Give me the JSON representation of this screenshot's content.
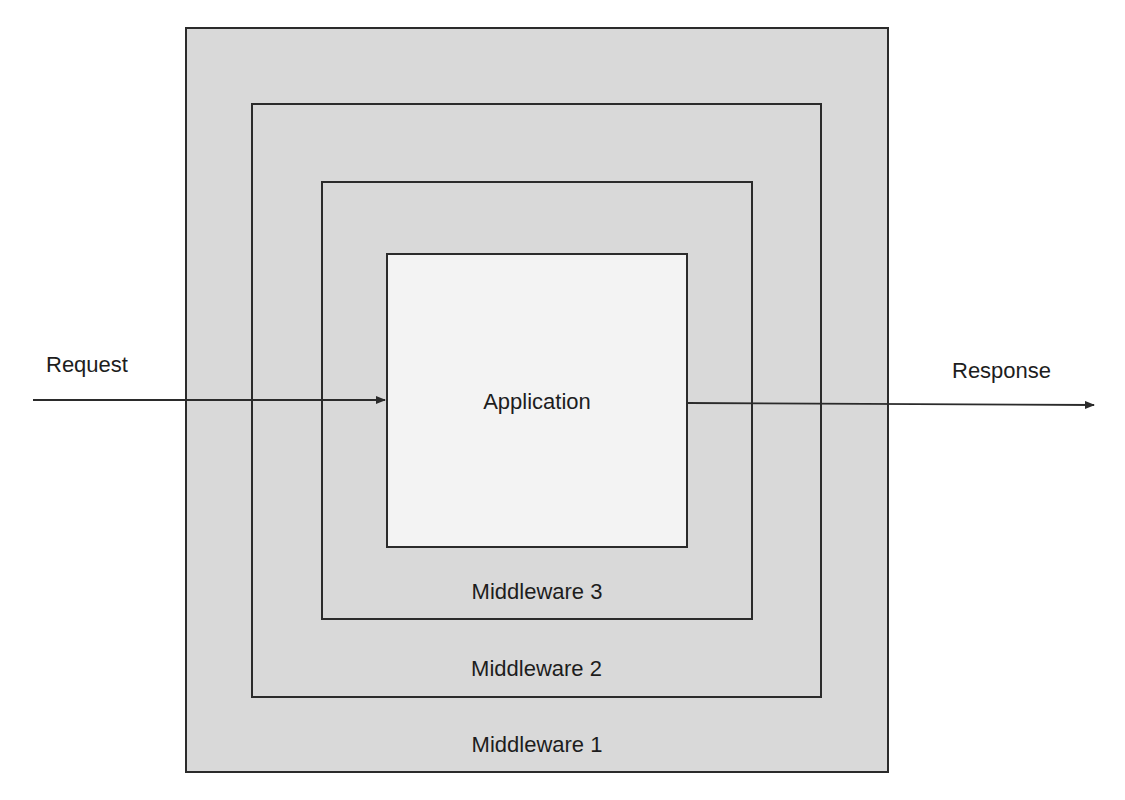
{
  "diagram": {
    "type": "nested-layers",
    "layers": [
      {
        "label": "Middleware 1",
        "level": 1
      },
      {
        "label": "Middleware 2",
        "level": 2
      },
      {
        "label": "Middleware 3",
        "level": 3
      }
    ],
    "core": {
      "label": "Application"
    },
    "input": {
      "label": "Request"
    },
    "output": {
      "label": "Response"
    },
    "colors": {
      "layer_fill": "#d9d9d9",
      "core_fill": "#f3f3f3",
      "stroke": "#2b2b2b",
      "background": "#ffffff"
    }
  }
}
